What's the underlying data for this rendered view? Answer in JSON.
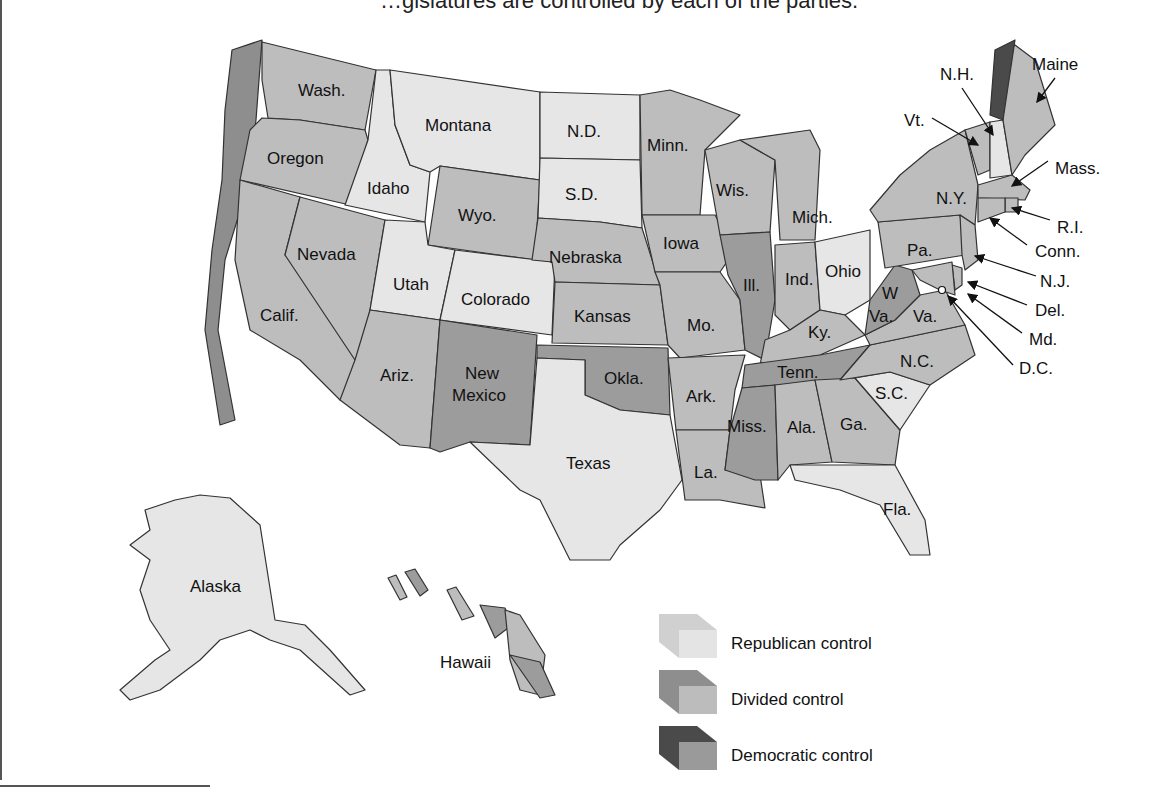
{
  "caption": "…gislatures are controlled by each of the parties.",
  "legend": [
    {
      "key": "R",
      "label": "Republican control",
      "top": "#e4e4e4",
      "side": "#d0d0d0"
    },
    {
      "key": "S",
      "label": "Divided control",
      "top": "#bcbcbc",
      "side": "#8e8e8e"
    },
    {
      "key": "D",
      "label": "Democratic control",
      "top": "#9a9a9a",
      "side": "#4a4a4a"
    }
  ],
  "colors": {
    "R": "#e6e6e6",
    "S": "#bdbdbd",
    "D": "#9c9c9c",
    "border": "#333333",
    "side_S": "#8e8e8e",
    "side_D": "#4a4a4a"
  },
  "states": [
    {
      "name": "Wash.",
      "control": "S"
    },
    {
      "name": "Oregon",
      "control": "S"
    },
    {
      "name": "Calif.",
      "control": "S"
    },
    {
      "name": "Idaho",
      "control": "R"
    },
    {
      "name": "Nevada",
      "control": "S"
    },
    {
      "name": "Montana",
      "control": "R"
    },
    {
      "name": "Wyo.",
      "control": "S"
    },
    {
      "name": "Utah",
      "control": "R"
    },
    {
      "name": "Colorado",
      "control": "R"
    },
    {
      "name": "Ariz.",
      "control": "S"
    },
    {
      "name": "New Mexico",
      "control": "D"
    },
    {
      "name": "N.D.",
      "control": "R"
    },
    {
      "name": "S.D.",
      "control": "R"
    },
    {
      "name": "Nebraska",
      "control": "S"
    },
    {
      "name": "Kansas",
      "control": "S"
    },
    {
      "name": "Okla.",
      "control": "D"
    },
    {
      "name": "Texas",
      "control": "R"
    },
    {
      "name": "Minn.",
      "control": "S"
    },
    {
      "name": "Iowa",
      "control": "S"
    },
    {
      "name": "Mo.",
      "control": "S"
    },
    {
      "name": "Ark.",
      "control": "S"
    },
    {
      "name": "La.",
      "control": "S"
    },
    {
      "name": "Wis.",
      "control": "S"
    },
    {
      "name": "Ill.",
      "control": "D"
    },
    {
      "name": "Mich.",
      "control": "S"
    },
    {
      "name": "Ind.",
      "control": "S"
    },
    {
      "name": "Ohio",
      "control": "R"
    },
    {
      "name": "Ky.",
      "control": "S"
    },
    {
      "name": "Tenn.",
      "control": "D"
    },
    {
      "name": "Miss.",
      "control": "D"
    },
    {
      "name": "Ala.",
      "control": "S"
    },
    {
      "name": "Ga.",
      "control": "S"
    },
    {
      "name": "Fla.",
      "control": "R"
    },
    {
      "name": "S.C.",
      "control": "R"
    },
    {
      "name": "N.C.",
      "control": "S"
    },
    {
      "name": "Va.",
      "control": "S"
    },
    {
      "name": "W. Va.",
      "control": "D"
    },
    {
      "name": "Pa.",
      "control": "S"
    },
    {
      "name": "N.Y.",
      "control": "S"
    },
    {
      "name": "Vt.",
      "control": "S"
    },
    {
      "name": "N.H.",
      "control": "R"
    },
    {
      "name": "Maine",
      "control": "S"
    },
    {
      "name": "Mass.",
      "control": "S"
    },
    {
      "name": "R.I.",
      "control": "S"
    },
    {
      "name": "Conn.",
      "control": "S"
    },
    {
      "name": "N.J.",
      "control": "S"
    },
    {
      "name": "Del.",
      "control": "S"
    },
    {
      "name": "Md.",
      "control": "S"
    },
    {
      "name": "D.C.",
      "control": "S"
    },
    {
      "name": "Alaska",
      "control": "R"
    },
    {
      "name": "Hawaii",
      "control": "S"
    }
  ],
  "labels": {
    "wash": "Wash.",
    "oregon": "Oregon",
    "calif": "Calif.",
    "idaho": "Idaho",
    "nevada": "Nevada",
    "montana": "Montana",
    "wyo": "Wyo.",
    "utah": "Utah",
    "colorado": "Colorado",
    "ariz": "Ariz.",
    "nm1": "New",
    "nm2": "Mexico",
    "nd": "N.D.",
    "sd": "S.D.",
    "nebraska": "Nebraska",
    "kansas": "Kansas",
    "okla": "Okla.",
    "texas": "Texas",
    "minn": "Minn.",
    "iowa": "Iowa",
    "mo": "Mo.",
    "ark": "Ark.",
    "la": "La.",
    "wis": "Wis.",
    "ill": "Ill.",
    "mich": "Mich.",
    "ind": "Ind.",
    "ohio": "Ohio",
    "ky": "Ky.",
    "tenn": "Tenn.",
    "miss": "Miss.",
    "ala": "Ala.",
    "ga": "Ga.",
    "fla": "Fla.",
    "sc": "S.C.",
    "nc": "N.C.",
    "va": "Va.",
    "wva1": "W",
    "wva2": "Va.",
    "pa": "Pa.",
    "ny": "N.Y.",
    "vt": "Vt.",
    "nh": "N.H.",
    "maine": "Maine",
    "mass": "Mass.",
    "ri": "R.I.",
    "conn": "Conn.",
    "nj": "N.J.",
    "del": "Del.",
    "md": "Md.",
    "dc": "D.C.",
    "alaska": "Alaska",
    "hawaii": "Hawaii"
  }
}
